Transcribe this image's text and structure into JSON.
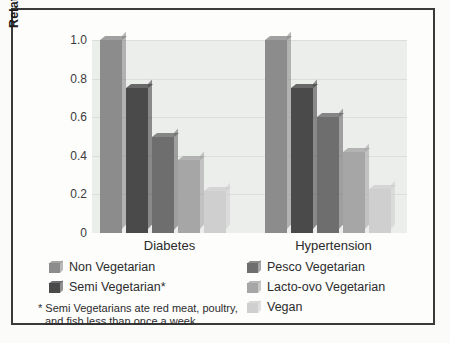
{
  "chart_data": {
    "type": "bar",
    "title": "",
    "xlabel": "",
    "ylabel": "Relative Risk of Disease",
    "ylim": [
      0,
      1.0
    ],
    "ytick_labels": [
      "1.0",
      "0.8",
      "0.6",
      "0.4",
      "0.2",
      "0"
    ],
    "ytick_values": [
      1.0,
      0.8,
      0.6,
      0.4,
      0.2,
      0
    ],
    "grid": true,
    "legend_position": "below-plot",
    "categories": [
      "Diabetes",
      "Hypertension"
    ],
    "series": [
      {
        "name": "Non Vegetarian",
        "values": [
          1.0,
          1.0
        ],
        "color": "#8c8c8c"
      },
      {
        "name": "Semi Vegetarian*",
        "values": [
          0.75,
          0.75
        ],
        "color": "#4a4a4a"
      },
      {
        "name": "Pesco Vegetarian",
        "values": [
          0.5,
          0.6
        ],
        "color": "#6e6e6e"
      },
      {
        "name": "Lacto-ovo Vegetarian",
        "values": [
          0.38,
          0.42
        ],
        "color": "#a6a6a6"
      },
      {
        "name": "Vegan",
        "values": [
          0.22,
          0.23
        ],
        "color": "#cfcfcf"
      }
    ],
    "annotations": [
      "* Semi Vegetarians ate red meat, poultry,",
      "and fish less than once a week"
    ]
  },
  "axis": {
    "y_title": "Relative Risk of Disease"
  },
  "group_labels": {
    "diabetes": "Diabetes",
    "hypertension": "Hypertension"
  },
  "legend": {
    "left": [
      {
        "label": "Non Vegetarian"
      },
      {
        "label": "Semi Vegetarian*"
      }
    ],
    "right": [
      {
        "label": "Pesco Vegetarian"
      },
      {
        "label": "Lacto-ovo Vegetarian"
      },
      {
        "label": "Vegan"
      }
    ]
  },
  "footnote": {
    "line1": "* Semi Vegetarians ate red meat, poultry,",
    "line2": "and fish less than once a week"
  },
  "colors": {
    "non_vegetarian": "#8c8c8c",
    "semi_vegetarian": "#4a4a4a",
    "pesco_vegetarian": "#6e6e6e",
    "lacto_ovo_vegetarian": "#a6a6a6",
    "vegan": "#cfcfcf",
    "plot_background": "#eceeec",
    "frame": "#3a3a3a"
  }
}
